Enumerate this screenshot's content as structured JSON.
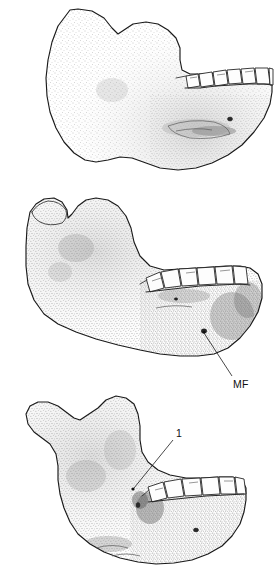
{
  "figure": {
    "kind": "scientific-line-illustration",
    "panel_count": 3,
    "background_color": "#ffffff",
    "ink_color": "#1a1a1a",
    "stipple_color": "#9a9a9a",
    "tooth_fill": "#fdfdfd"
  },
  "panels": [
    {
      "id": "panel-a",
      "position": "top",
      "view": "lateral right mandible, teeth toward right",
      "teeth_visible": 7,
      "annotations": []
    },
    {
      "id": "panel-b",
      "position": "middle",
      "view": "lateral mandible with condyle, teeth toward right",
      "teeth_visible": 5,
      "annotations": [
        {
          "id": "annotation-mf",
          "label": "MF",
          "meaning": "mental foramen",
          "label_x": 235,
          "label_y": 387,
          "leader_from_x": 204,
          "leader_from_y": 331,
          "leader_to_x": 232,
          "leader_to_y": 378
        }
      ]
    },
    {
      "id": "panel-c",
      "position": "bottom",
      "view": "lateral mandible fragment, teeth toward right",
      "teeth_visible": 6,
      "annotations": [
        {
          "id": "annotation-1",
          "label": "1",
          "meaning": "numbered feature callout",
          "label_x": 178,
          "label_y": 436,
          "leader_from_x": 172,
          "leader_from_y": 440,
          "leader_to_x": 133,
          "leader_to_y": 489
        }
      ]
    }
  ],
  "caption_alt": "Three stippled line drawings of hominin mandibles in lateral view; the middle one labels MF (mental foramen) and the bottom one labels feature 1."
}
